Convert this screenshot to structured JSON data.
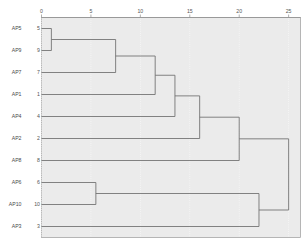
{
  "chart_data": {
    "type": "dendrogram",
    "title": "",
    "xlabel": "",
    "ylabel": "",
    "orientation": "horizontal",
    "xlim": [
      0,
      26.2
    ],
    "grid": true,
    "axis_position": "top",
    "xticks": [
      0,
      5,
      10,
      15,
      20,
      25
    ],
    "xtick_labels": [
      "0",
      "5",
      "10",
      "15",
      "20",
      "25"
    ],
    "leaves": [
      {
        "label": "AP5",
        "index": "5",
        "position": 0
      },
      {
        "label": "AP9",
        "index": "9",
        "position": 1
      },
      {
        "label": "AP7",
        "index": "7",
        "position": 2
      },
      {
        "label": "AP1",
        "index": "1",
        "position": 3
      },
      {
        "label": "AP4",
        "index": "4",
        "position": 4
      },
      {
        "label": "AP2",
        "index": "2",
        "position": 5
      },
      {
        "label": "AP8",
        "index": "8",
        "position": 6
      },
      {
        "label": "AP6",
        "index": "6",
        "position": 7
      },
      {
        "label": "AP10",
        "index": "10",
        "position": 8
      },
      {
        "label": "AP3",
        "index": "3",
        "position": 9
      }
    ],
    "merges": [
      {
        "id": "m1",
        "members": [
          "AP5",
          "AP9"
        ],
        "height": 1.0
      },
      {
        "id": "m2",
        "members": [
          "AP6",
          "AP10"
        ],
        "height": 5.5
      },
      {
        "id": "m3",
        "members": [
          "AP5",
          "AP9",
          "AP7"
        ],
        "height": 7.5
      },
      {
        "id": "m4",
        "members": [
          "AP5",
          "AP9",
          "AP7",
          "AP1"
        ],
        "height": 11.5
      },
      {
        "id": "m5",
        "members": [
          "AP5",
          "AP9",
          "AP7",
          "AP1",
          "AP4"
        ],
        "height": 13.5
      },
      {
        "id": "m6",
        "members": [
          "AP5",
          "AP9",
          "AP7",
          "AP1",
          "AP4",
          "AP2"
        ],
        "height": 16.0
      },
      {
        "id": "m7",
        "members": [
          "AP5",
          "AP9",
          "AP7",
          "AP1",
          "AP4",
          "AP2",
          "AP8"
        ],
        "height": 20.0
      },
      {
        "id": "m8",
        "members": [
          "AP6",
          "AP10",
          "AP3"
        ],
        "height": 22.0
      },
      {
        "id": "m9",
        "members": [
          "AP5",
          "AP9",
          "AP7",
          "AP1",
          "AP4",
          "AP2",
          "AP8",
          "AP6",
          "AP10",
          "AP3"
        ],
        "height": 25.0
      }
    ],
    "colors": {
      "plot_background": "#ebebeb",
      "link": "#6e6e6e",
      "grid": "#ffffff",
      "axis": "#8d8d8d",
      "text": "#555555"
    }
  }
}
